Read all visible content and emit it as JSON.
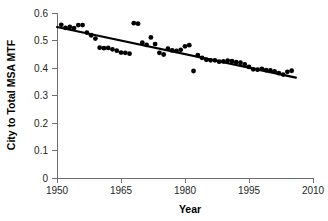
{
  "chart_data": {
    "type": "scatter",
    "title": "",
    "xlabel": "Year",
    "ylabel": "City to Total MSA MTF",
    "xlim": [
      1950,
      2010
    ],
    "ylim": [
      0,
      0.6
    ],
    "xticks": [
      1950,
      1965,
      1980,
      1995,
      2010
    ],
    "xtick_labels": [
      "1950",
      "1965",
      "1980",
      "1995",
      "2010"
    ],
    "yticks": [
      0,
      0.1,
      0.2,
      0.3,
      0.4,
      0.5,
      0.6
    ],
    "ytick_labels": [
      "0",
      "0.1",
      "0.2",
      "0.3",
      "0.4",
      "0.5",
      "0.6"
    ],
    "grid": false,
    "legend": null,
    "marker": "filled-circle",
    "marker_color": "#000000",
    "series": [
      {
        "name": "City to Total MSA MTF",
        "type": "scatter",
        "x": [
          1951,
          1952,
          1953,
          1954,
          1955,
          1956,
          1957,
          1958,
          1959,
          1960,
          1961,
          1962,
          1963,
          1964,
          1965,
          1966,
          1967,
          1968,
          1969,
          1970,
          1971,
          1972,
          1973,
          1974,
          1975,
          1976,
          1977,
          1978,
          1979,
          1980,
          1981,
          1982,
          1983,
          1984,
          1985,
          1986,
          1987,
          1988,
          1989,
          1990,
          1991,
          1992,
          1993,
          1994,
          1995,
          1996,
          1997,
          1998,
          1999,
          2000,
          2001,
          2002,
          2003,
          2004,
          2005
        ],
        "y": [
          0.557,
          0.546,
          0.549,
          0.545,
          0.556,
          0.556,
          0.529,
          0.519,
          0.507,
          0.474,
          0.472,
          0.473,
          0.468,
          0.463,
          0.456,
          0.455,
          0.452,
          0.563,
          0.561,
          0.492,
          0.484,
          0.511,
          0.487,
          0.455,
          0.449,
          0.47,
          0.464,
          0.462,
          0.466,
          0.479,
          0.483,
          0.389,
          0.447,
          0.437,
          0.43,
          0.428,
          0.428,
          0.423,
          0.424,
          0.427,
          0.425,
          0.421,
          0.419,
          0.413,
          0.404,
          0.395,
          0.394,
          0.397,
          0.392,
          0.391,
          0.388,
          0.381,
          0.376,
          0.386,
          0.39
        ]
      },
      {
        "name": "linear trend",
        "type": "line",
        "x": [
          1950,
          2006
        ],
        "y": [
          0.549,
          0.365
        ]
      }
    ]
  },
  "axes": {
    "x_axis_label": "Year",
    "y_axis_label": "City to Total MSA MTF"
  }
}
